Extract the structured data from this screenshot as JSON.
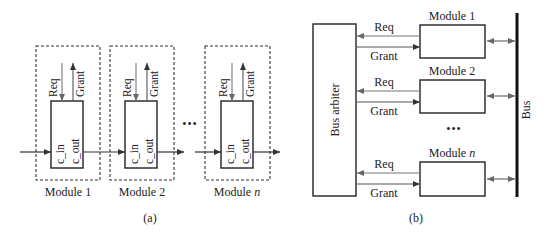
{
  "panel_a": {
    "caption": "(a)",
    "ellipsis": "•••",
    "modules": [
      {
        "label": "Module 1",
        "req": "Req",
        "grant": "Grant",
        "c_in": "c_in",
        "c_out": "c_out"
      },
      {
        "label": "Module 2",
        "req": "Req",
        "grant": "Grant",
        "c_in": "c_in",
        "c_out": "c_out"
      },
      {
        "label_prefix": "Module ",
        "label_var": "n",
        "req": "Req",
        "grant": "Grant",
        "c_in": "c_in",
        "c_out": "c_out"
      }
    ]
  },
  "panel_b": {
    "caption": "(b)",
    "arbiter_label": "Bus arbiter",
    "bus_label": "Bus",
    "ellipsis": "•••",
    "modules": [
      {
        "label": "Module 1",
        "req": "Req",
        "grant": "Grant"
      },
      {
        "label": "Module 2",
        "req": "Req",
        "grant": "Grant"
      },
      {
        "label_prefix": "Module ",
        "label_var": "n",
        "req": "Req",
        "grant": "Grant"
      }
    ]
  },
  "colors": {
    "stroke": "#222222",
    "arrow": "#666666",
    "bus": "#111111"
  }
}
